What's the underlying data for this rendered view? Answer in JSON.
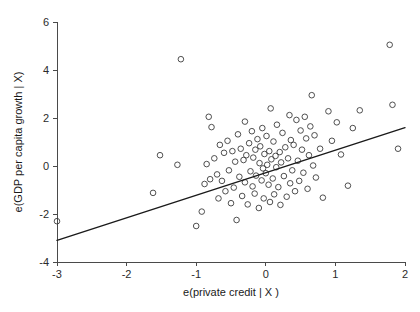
{
  "chart_data": {
    "type": "scatter",
    "title": "",
    "subtitle": "",
    "xlabel": "e(private credit | X )",
    "ylabel": "e(GDP per capita growth | X)",
    "xlim": [
      -3.2,
      2.05
    ],
    "ylim": [
      -4.0,
      6.2
    ],
    "xticks": [
      -3,
      -2,
      -1,
      0,
      1,
      2
    ],
    "xtick_labels": [
      "-3",
      "-2",
      "-1",
      "0",
      "1",
      "2"
    ],
    "yticks": [
      -4,
      -2,
      0,
      2,
      4,
      6
    ],
    "ytick_labels": [
      "-4",
      "-2",
      "0",
      "2",
      "4",
      "6"
    ],
    "grid": false,
    "legend": null,
    "marker": {
      "shape": "open-circle",
      "radius": 2.8,
      "edge_color": "#3c3c3c",
      "fill_color": "none"
    },
    "fit_line": {
      "name": "linear fit",
      "color": "#1a1a1a",
      "x": [
        -3.0,
        2.0
      ],
      "y": [
        -3.1,
        1.6
      ],
      "slope": 0.94,
      "intercept": -0.28
    },
    "points": [
      [
        -3.0,
        -2.3
      ],
      [
        -1.62,
        -1.12
      ],
      [
        -1.52,
        0.45
      ],
      [
        -1.27,
        0.05
      ],
      [
        -1.22,
        4.45
      ],
      [
        -1.0,
        -2.5
      ],
      [
        -0.92,
        -1.9
      ],
      [
        -0.88,
        -0.75
      ],
      [
        -0.85,
        0.08
      ],
      [
        -0.82,
        2.05
      ],
      [
        -0.8,
        -0.55
      ],
      [
        -0.78,
        1.62
      ],
      [
        -0.74,
        0.32
      ],
      [
        -0.7,
        -0.35
      ],
      [
        -0.68,
        -1.35
      ],
      [
        -0.66,
        0.88
      ],
      [
        -0.63,
        -0.62
      ],
      [
        -0.6,
        0.55
      ],
      [
        -0.58,
        -1.05
      ],
      [
        -0.55,
        1.05
      ],
      [
        -0.53,
        -0.18
      ],
      [
        -0.5,
        -1.55
      ],
      [
        -0.48,
        0.62
      ],
      [
        -0.46,
        -0.9
      ],
      [
        -0.44,
        0.18
      ],
      [
        -0.42,
        -2.25
      ],
      [
        -0.4,
        1.32
      ],
      [
        -0.38,
        -0.45
      ],
      [
        -0.36,
        0.72
      ],
      [
        -0.34,
        -1.25
      ],
      [
        -0.32,
        0.25
      ],
      [
        -0.3,
        -0.68
      ],
      [
        -0.3,
        1.85
      ],
      [
        -0.28,
        0.45
      ],
      [
        -0.26,
        -1.6
      ],
      [
        -0.24,
        0.95
      ],
      [
        -0.22,
        -0.22
      ],
      [
        -0.2,
        1.45
      ],
      [
        -0.19,
        -0.85
      ],
      [
        -0.18,
        0.35
      ],
      [
        -0.16,
        -1.15
      ],
      [
        -0.15,
        0.68
      ],
      [
        -0.14,
        -0.4
      ],
      [
        -0.12,
        1.12
      ],
      [
        -0.1,
        -1.75
      ],
      [
        -0.09,
        0.12
      ],
      [
        -0.08,
        0.82
      ],
      [
        -0.06,
        -0.6
      ],
      [
        -0.05,
        1.58
      ],
      [
        -0.04,
        -0.1
      ],
      [
        -0.03,
        -1.35
      ],
      [
        -0.02,
        0.5
      ],
      [
        0.0,
        -0.3
      ],
      [
        0.01,
        1.25
      ],
      [
        0.02,
        0.05
      ],
      [
        0.04,
        -0.78
      ],
      [
        0.05,
        0.62
      ],
      [
        0.06,
        -1.5
      ],
      [
        0.07,
        2.4
      ],
      [
        0.08,
        0.28
      ],
      [
        0.1,
        -0.52
      ],
      [
        0.11,
        1.02
      ],
      [
        0.12,
        -1.18
      ],
      [
        0.14,
        0.42
      ],
      [
        0.15,
        -0.05
      ],
      [
        0.16,
        1.72
      ],
      [
        0.18,
        -0.88
      ],
      [
        0.2,
        0.58
      ],
      [
        0.21,
        -1.62
      ],
      [
        0.22,
        0.15
      ],
      [
        0.24,
        1.38
      ],
      [
        0.26,
        -0.42
      ],
      [
        0.28,
        0.78
      ],
      [
        0.3,
        -1.28
      ],
      [
        0.32,
        0.32
      ],
      [
        0.34,
        2.12
      ],
      [
        0.35,
        -0.72
      ],
      [
        0.36,
        1.08
      ],
      [
        0.38,
        -0.18
      ],
      [
        0.4,
        0.88
      ],
      [
        0.42,
        -1.05
      ],
      [
        0.44,
        1.92
      ],
      [
        0.46,
        0.22
      ],
      [
        0.48,
        -0.62
      ],
      [
        0.5,
        1.48
      ],
      [
        0.52,
        0.68
      ],
      [
        0.54,
        -0.28
      ],
      [
        0.56,
        2.05
      ],
      [
        0.58,
        1.15
      ],
      [
        0.6,
        -0.95
      ],
      [
        0.62,
        0.45
      ],
      [
        0.64,
        1.65
      ],
      [
        0.66,
        2.95
      ],
      [
        0.68,
        0.02
      ],
      [
        0.7,
        1.28
      ],
      [
        0.72,
        -0.48
      ],
      [
        0.78,
        0.72
      ],
      [
        0.82,
        -1.32
      ],
      [
        0.9,
        2.28
      ],
      [
        0.95,
        1.05
      ],
      [
        1.02,
        1.82
      ],
      [
        1.08,
        0.48
      ],
      [
        1.18,
        -0.82
      ],
      [
        1.25,
        1.58
      ],
      [
        1.35,
        2.32
      ],
      [
        1.78,
        5.05
      ],
      [
        1.82,
        2.55
      ],
      [
        1.9,
        0.72
      ]
    ]
  }
}
